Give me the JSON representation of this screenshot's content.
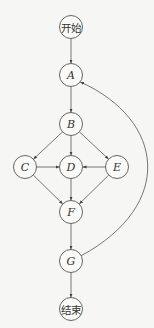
{
  "diagram": {
    "type": "flowchart",
    "nodes": [
      {
        "id": "start",
        "label": "开始",
        "cn": true
      },
      {
        "id": "A",
        "label": "A"
      },
      {
        "id": "B",
        "label": "B"
      },
      {
        "id": "C",
        "label": "C"
      },
      {
        "id": "D",
        "label": "D"
      },
      {
        "id": "E",
        "label": "E"
      },
      {
        "id": "F",
        "label": "F"
      },
      {
        "id": "G",
        "label": "G"
      },
      {
        "id": "end",
        "label": "结束",
        "cn": true
      }
    ],
    "edges": [
      {
        "from": "start",
        "to": "A"
      },
      {
        "from": "A",
        "to": "B"
      },
      {
        "from": "B",
        "to": "C"
      },
      {
        "from": "B",
        "to": "D"
      },
      {
        "from": "B",
        "to": "E"
      },
      {
        "from": "C",
        "to": "D"
      },
      {
        "from": "E",
        "to": "D"
      },
      {
        "from": "C",
        "to": "F"
      },
      {
        "from": "D",
        "to": "F"
      },
      {
        "from": "E",
        "to": "F"
      },
      {
        "from": "F",
        "to": "G"
      },
      {
        "from": "G",
        "to": "A",
        "curved": true
      },
      {
        "from": "G",
        "to": "end"
      }
    ]
  }
}
